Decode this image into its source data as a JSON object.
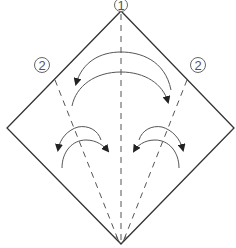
{
  "diagram": {
    "type": "origami-fold-instruction",
    "shape": "square-diamond",
    "step_labels": [
      {
        "id": "step-1",
        "text": "1",
        "x": 121,
        "y": 5
      },
      {
        "id": "step-2-left",
        "text": "2",
        "x": 42,
        "y": 65
      },
      {
        "id": "step-2-right",
        "text": "2",
        "x": 198,
        "y": 65
      }
    ],
    "vertices": {
      "top": [
        121,
        11
      ],
      "right": [
        234,
        128
      ],
      "bottom": [
        121,
        244
      ],
      "left": [
        7,
        128
      ]
    },
    "fold_lines": [
      {
        "id": "center-valley-fold",
        "from": [
          121,
          13
        ],
        "to": [
          121,
          240
        ]
      },
      {
        "id": "left-valley-fold",
        "from": [
          55,
          82
        ],
        "to": [
          118,
          240
        ]
      },
      {
        "id": "right-valley-fold",
        "from": [
          187,
          82
        ],
        "to": [
          124,
          240
        ]
      }
    ],
    "colors": {
      "outline": "#333333",
      "fold_line": "#555555",
      "arrow": "#555555",
      "label": "#555555"
    }
  }
}
